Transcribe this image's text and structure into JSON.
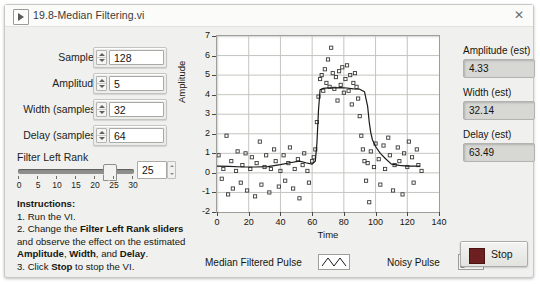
{
  "window": {
    "title": "19.8-Median Filtering.vi",
    "run_icon": "run-arrow-icon",
    "close_label": "✕"
  },
  "controls": [
    {
      "label": "Samples",
      "value": "128",
      "name": "samples"
    },
    {
      "label": "Amplitude",
      "value": "5",
      "name": "amplitude"
    },
    {
      "label": "Width (samples)",
      "value": "32",
      "name": "width-samples"
    },
    {
      "label": "Delay (samples)",
      "value": "64",
      "name": "delay-samples"
    }
  ],
  "slider": {
    "label": "Filter Left Rank",
    "value": "25",
    "min": 0,
    "max": 30,
    "ticks": [
      "0",
      "5",
      "10",
      "15",
      "20",
      "25",
      "30"
    ]
  },
  "instructions": {
    "heading": "Instructions:",
    "line1": "1. Run the VI.",
    "line2a": "2. Change the ",
    "line2b": "Filter Left Rank sliders",
    "line3": "and observe the effect on the estimated",
    "line4a": "Amplitude",
    "line4b": ", ",
    "line4c": "Width",
    "line4d": ", and ",
    "line4e": "Delay",
    "line4f": ".",
    "line5a": "3. Click ",
    "line5b": "Stop",
    "line5c": " to stop the VI."
  },
  "indicators": [
    {
      "label": "Amplitude (est)",
      "value": "4.33",
      "name": "amplitude-est"
    },
    {
      "label": "Width (est)",
      "value": "32.14",
      "name": "width-est"
    },
    {
      "label": "Delay (est)",
      "value": "63.49",
      "name": "delay-est"
    }
  ],
  "legend": {
    "filtered_label": "Median Filtered Pulse",
    "noisy_label": "Noisy Pulse"
  },
  "stop_button": {
    "label": "Stop",
    "color": "#6d2020"
  },
  "chart_data": {
    "type": "scatter",
    "title": "",
    "xlabel": "Time",
    "ylabel": "Amplitude",
    "xlim": [
      0,
      140
    ],
    "ylim": [
      -2,
      7
    ],
    "xticks": [
      0,
      20,
      40,
      60,
      80,
      100,
      120,
      140
    ],
    "yticks": [
      -2,
      -1,
      0,
      1,
      2,
      3,
      4,
      5,
      6,
      7
    ],
    "grid": true,
    "legend_position": "below",
    "series": [
      {
        "name": "Noisy Pulse",
        "type": "scatter",
        "marker": "open-square",
        "color": "#3a3a38",
        "x": [
          1,
          3,
          4,
          6,
          7,
          9,
          10,
          12,
          13,
          15,
          16,
          18,
          19,
          21,
          22,
          24,
          25,
          27,
          28,
          30,
          31,
          33,
          34,
          36,
          37,
          39,
          40,
          42,
          43,
          45,
          46,
          48,
          49,
          51,
          52,
          54,
          55,
          57,
          58,
          60,
          61,
          62,
          63,
          64,
          65,
          66,
          67,
          68,
          69,
          70,
          71,
          72,
          73,
          74,
          75,
          76,
          77,
          78,
          79,
          80,
          81,
          82,
          83,
          84,
          85,
          86,
          87,
          88,
          89,
          90,
          91,
          92,
          93,
          94,
          95,
          96,
          97,
          99,
          100,
          102,
          103,
          105,
          106,
          108,
          109,
          111,
          112,
          114,
          115,
          117,
          118,
          120,
          121,
          123,
          124,
          126,
          127,
          129
        ],
        "y": [
          0.9,
          -0.3,
          0.2,
          1.9,
          -1.1,
          0.6,
          -0.8,
          0.1,
          1.1,
          -0.5,
          0.4,
          1.0,
          -0.9,
          0.2,
          0.8,
          -1.2,
          0.5,
          1.6,
          -0.6,
          0.3,
          0.9,
          -1.0,
          0.2,
          1.2,
          0.6,
          -0.7,
          0.1,
          0.9,
          -0.4,
          0.5,
          1.3,
          -0.8,
          0.2,
          0.7,
          -1.3,
          0.4,
          1.0,
          0.1,
          -0.5,
          0.6,
          0.8,
          1.2,
          2.6,
          3.9,
          4.8,
          5.0,
          4.2,
          5.3,
          4.6,
          5.8,
          4.4,
          6.4,
          5.1,
          4.3,
          4.9,
          3.7,
          5.2,
          4.5,
          5.4,
          4.1,
          4.8,
          5.5,
          4.2,
          5.0,
          3.5,
          4.6,
          5.1,
          4.4,
          3.8,
          2.9,
          1.9,
          1.2,
          0.6,
          -0.4,
          0.5,
          -1.5,
          1.1,
          0.3,
          1.5,
          0.7,
          -0.6,
          1.4,
          0.2,
          1.8,
          0.9,
          -0.9,
          0.4,
          1.3,
          0.6,
          -1.1,
          1.0,
          0.3,
          1.6,
          0.8,
          -0.5,
          1.2,
          0.4,
          0.1
        ]
      },
      {
        "name": "Median Filtered Pulse",
        "type": "line",
        "color": "#1a1a18",
        "x": [
          0,
          8,
          16,
          24,
          32,
          40,
          46,
          52,
          56,
          60,
          62,
          63,
          64,
          65,
          67,
          70,
          74,
          78,
          82,
          86,
          90,
          93,
          95,
          96,
          97,
          98,
          100,
          103,
          106,
          110,
          115,
          120,
          128
        ],
        "y": [
          0.35,
          0.33,
          0.3,
          0.3,
          0.32,
          0.42,
          0.52,
          0.6,
          0.52,
          0.45,
          0.6,
          1.5,
          3.2,
          4.25,
          4.32,
          4.35,
          4.35,
          4.36,
          4.34,
          4.3,
          4.28,
          4.15,
          3.4,
          2.6,
          2.05,
          1.7,
          1.35,
          1.0,
          0.75,
          0.45,
          0.38,
          0.35,
          0.35
        ]
      }
    ]
  }
}
